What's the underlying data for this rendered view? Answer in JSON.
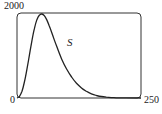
{
  "chart_data": {
    "type": "line",
    "title": "",
    "xlabel": "",
    "ylabel": "",
    "xlim": [
      0,
      250
    ],
    "ylim": [
      0,
      2000
    ],
    "grid": false,
    "tick_labels": {
      "y_top": "2000",
      "origin": "0",
      "x_right": "250"
    },
    "series": [
      {
        "name": "S",
        "x": [
          0,
          5,
          10,
          15,
          20,
          25,
          30,
          35,
          40,
          45,
          50,
          55,
          60,
          65,
          70,
          75,
          80,
          90,
          100,
          110,
          120,
          130,
          140,
          150,
          160,
          170,
          180,
          190,
          200,
          220,
          250
        ],
        "values": [
          0,
          40,
          160,
          380,
          680,
          1020,
          1360,
          1650,
          1860,
          1970,
          2000,
          1960,
          1860,
          1720,
          1560,
          1390,
          1230,
          930,
          690,
          500,
          350,
          240,
          160,
          100,
          60,
          35,
          20,
          10,
          5,
          2,
          0
        ]
      }
    ],
    "annotations": [
      {
        "text": "S",
        "x": 78,
        "y": 1380
      }
    ]
  }
}
